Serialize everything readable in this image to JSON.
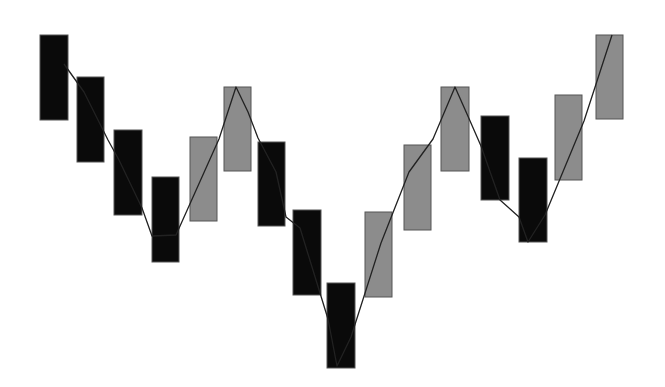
{
  "chart_data": {
    "type": "bar",
    "subtype": "floating-box / renko-style with connecting zigzag line",
    "title": "",
    "xlabel": "",
    "ylabel": "",
    "grid": false,
    "legend": null,
    "colors": {
      "down": "#0a0a0a",
      "up": "#8c8c8c",
      "stroke": "#555555",
      "line": "#222222",
      "background": "#ffffff"
    },
    "categories": [
      1,
      2,
      3,
      4,
      5,
      6,
      7,
      8,
      9,
      10,
      11,
      12,
      13,
      14,
      15,
      16
    ],
    "boxes": [
      {
        "x": 40,
        "w": 28,
        "top": 35,
        "bottom": 120,
        "dir": "down"
      },
      {
        "x": 77,
        "w": 27,
        "top": 77,
        "bottom": 162,
        "dir": "down"
      },
      {
        "x": 114,
        "w": 28,
        "top": 130,
        "bottom": 215,
        "dir": "down"
      },
      {
        "x": 152,
        "w": 27,
        "top": 177,
        "bottom": 262,
        "dir": "down"
      },
      {
        "x": 190,
        "w": 27,
        "top": 137,
        "bottom": 221,
        "dir": "up"
      },
      {
        "x": 224,
        "w": 27,
        "top": 87,
        "bottom": 171,
        "dir": "up"
      },
      {
        "x": 258,
        "w": 27,
        "top": 142,
        "bottom": 226,
        "dir": "down"
      },
      {
        "x": 293,
        "w": 28,
        "top": 210,
        "bottom": 295,
        "dir": "down"
      },
      {
        "x": 327,
        "w": 28,
        "top": 283,
        "bottom": 368,
        "dir": "down"
      },
      {
        "x": 365,
        "w": 27,
        "top": 212,
        "bottom": 297,
        "dir": "up"
      },
      {
        "x": 404,
        "w": 27,
        "top": 145,
        "bottom": 230,
        "dir": "up"
      },
      {
        "x": 441,
        "w": 28,
        "top": 87,
        "bottom": 171,
        "dir": "up"
      },
      {
        "x": 481,
        "w": 28,
        "top": 116,
        "bottom": 200,
        "dir": "down"
      },
      {
        "x": 519,
        "w": 28,
        "top": 158,
        "bottom": 242,
        "dir": "down"
      },
      {
        "x": 555,
        "w": 27,
        "top": 95,
        "bottom": 180,
        "dir": "up"
      },
      {
        "x": 596,
        "w": 27,
        "top": 35,
        "bottom": 119,
        "dir": "up"
      }
    ],
    "relative_values": {
      "note": "Estimated relative levels (higher = up), box spans low–high",
      "highs": [
        10,
        8,
        5.5,
        3.3,
        5.2,
        7.5,
        5,
        1.8,
        -1.6,
        1.7,
        4.8,
        7.5,
        6.2,
        4.3,
        7.1,
        10
      ],
      "lows": [
        6,
        4,
        1.5,
        -0.7,
        1.3,
        3.6,
        1,
        -2.2,
        -5.6,
        -2.3,
        0.9,
        3.6,
        2.3,
        0.4,
        3.1,
        6.1
      ]
    },
    "line_points": [
      [
        64,
        64
      ],
      [
        84,
        92
      ],
      [
        108,
        140
      ],
      [
        119,
        160
      ],
      [
        142,
        208
      ],
      [
        152,
        236
      ],
      [
        176,
        235
      ],
      [
        219,
        139
      ],
      [
        236,
        87
      ],
      [
        248,
        112
      ],
      [
        258,
        138
      ],
      [
        276,
        172
      ],
      [
        286,
        217
      ],
      [
        300,
        228
      ],
      [
        328,
        319
      ],
      [
        337,
        366
      ],
      [
        351,
        337
      ],
      [
        381,
        243
      ],
      [
        409,
        172
      ],
      [
        433,
        139
      ],
      [
        455,
        87
      ],
      [
        467,
        114
      ],
      [
        481,
        146
      ],
      [
        500,
        200
      ],
      [
        519,
        217
      ],
      [
        528,
        242
      ],
      [
        545,
        215
      ],
      [
        584,
        121
      ],
      [
        612,
        35
      ]
    ]
  }
}
